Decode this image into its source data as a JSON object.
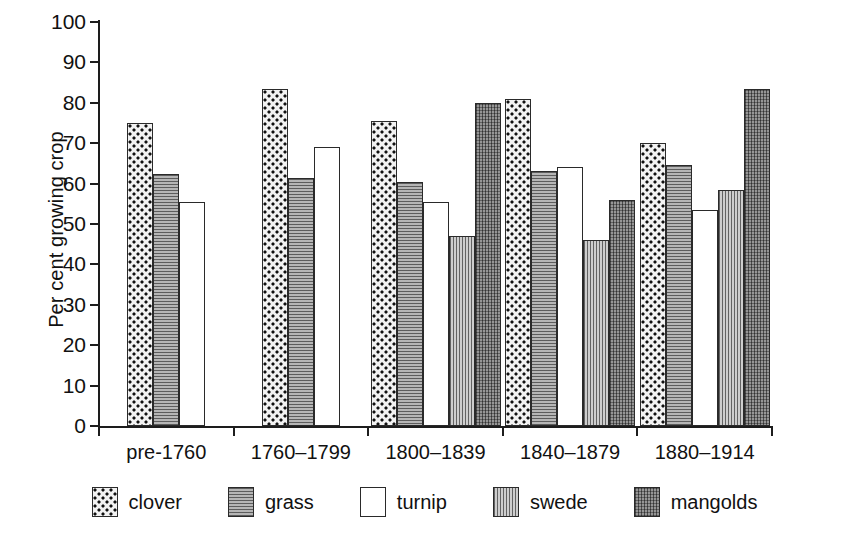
{
  "chart_data": {
    "type": "bar",
    "title": "",
    "xlabel": "",
    "ylabel": "Per cent growing crop",
    "ylim": [
      0,
      100
    ],
    "ytick_step": 10,
    "yticks": [
      100,
      90,
      80,
      70,
      60,
      50,
      40,
      30,
      20,
      10,
      0
    ],
    "grid": false,
    "legend_position": "bottom",
    "categories": [
      "pre-1760",
      "1760–1799",
      "1800–1839",
      "1840–1879",
      "1880–1914"
    ],
    "series": [
      {
        "name": "clover",
        "values": [
          75,
          83.5,
          75.5,
          81,
          70
        ]
      },
      {
        "name": "grass",
        "values": [
          62.5,
          61.5,
          60.5,
          63,
          64.5
        ]
      },
      {
        "name": "turnip",
        "values": [
          55.5,
          69,
          55.5,
          64,
          53.5
        ]
      },
      {
        "name": "swede",
        "values": [
          null,
          null,
          47,
          46,
          58.5
        ]
      },
      {
        "name": "mangolds",
        "values": [
          null,
          null,
          80,
          56,
          83.5
        ]
      }
    ]
  },
  "axes": {
    "y_title": "Per cent growing crop",
    "y_tick_labels": [
      "100",
      "90",
      "80",
      "70",
      "60",
      "50",
      "40",
      "30",
      "20",
      "10",
      "0"
    ],
    "x_tick_labels": [
      "pre-1760",
      "1760–1799",
      "1800–1839",
      "1840–1879",
      "1880–1914"
    ]
  },
  "legend": {
    "items": [
      {
        "label": "clover",
        "pattern": "checkered-dots",
        "color": "#f2f2f2"
      },
      {
        "label": "grass",
        "pattern": "horizontal-lines",
        "color": "#9d9d9d"
      },
      {
        "label": "turnip",
        "pattern": "solid-white",
        "color": "#ffffff"
      },
      {
        "label": "swede",
        "pattern": "vertical-lines",
        "color": "#b3b3b3"
      },
      {
        "label": "mangolds",
        "pattern": "cross-hatch",
        "color": "#7b7b7b"
      }
    ]
  },
  "colors": {
    "axis": "#1d1d1d",
    "text": "#111111",
    "background": "#ffffff"
  }
}
